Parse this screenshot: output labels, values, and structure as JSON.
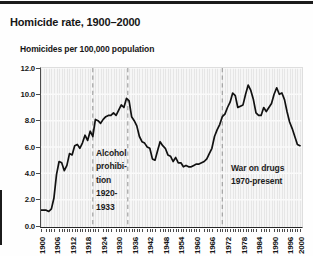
{
  "header": {
    "title": "Homicide rate, 1900–2000",
    "subtitle": "Homicides per 100,000 population"
  },
  "chart_data": {
    "type": "line",
    "title": "Homicide rate, 1900–2000",
    "ylabel": "Homicides per 100,000 population",
    "xlabel": "",
    "ylim": [
      0,
      12
    ],
    "line_color": "#111111",
    "grid": "horizontal white lines every 2.0 on striped gray panel",
    "legend": "none",
    "y_ticks": [
      "12.0",
      "10.0",
      "8.0",
      "6.0",
      "4.0",
      "2.0",
      "0.0"
    ],
    "grid_values": [
      2,
      4,
      6,
      8,
      10,
      12
    ],
    "x_ticks": [
      1900,
      1906,
      1912,
      1918,
      1924,
      1930,
      1936,
      1942,
      1948,
      1954,
      1960,
      1966,
      1972,
      1978,
      1984,
      1990,
      1996,
      2000
    ],
    "x": [
      1900,
      1901,
      1902,
      1903,
      1904,
      1905,
      1906,
      1907,
      1908,
      1909,
      1910,
      1911,
      1912,
      1913,
      1914,
      1915,
      1916,
      1917,
      1918,
      1919,
      1920,
      1921,
      1922,
      1923,
      1924,
      1925,
      1926,
      1927,
      1928,
      1929,
      1930,
      1931,
      1932,
      1933,
      1934,
      1935,
      1936,
      1937,
      1938,
      1939,
      1940,
      1941,
      1942,
      1943,
      1944,
      1945,
      1946,
      1947,
      1948,
      1949,
      1950,
      1951,
      1952,
      1953,
      1954,
      1955,
      1956,
      1957,
      1958,
      1959,
      1960,
      1961,
      1962,
      1963,
      1964,
      1965,
      1966,
      1967,
      1968,
      1969,
      1970,
      1971,
      1972,
      1973,
      1974,
      1975,
      1976,
      1977,
      1978,
      1979,
      1980,
      1981,
      1982,
      1983,
      1984,
      1985,
      1986,
      1987,
      1988,
      1989,
      1990,
      1991,
      1992,
      1993,
      1994,
      1995,
      1996,
      1997,
      1998,
      1999,
      2000
    ],
    "values": [
      1.2,
      1.2,
      1.2,
      1.1,
      1.3,
      2.1,
      3.9,
      4.9,
      4.8,
      4.2,
      4.6,
      5.5,
      5.4,
      6.1,
      6.2,
      5.9,
      6.3,
      6.9,
      6.5,
      7.2,
      6.8,
      8.1,
      8.0,
      7.8,
      8.1,
      8.3,
      8.4,
      8.4,
      8.6,
      8.4,
      8.8,
      9.2,
      9.0,
      9.7,
      9.5,
      8.3,
      8.0,
      7.6,
      6.8,
      6.4,
      6.3,
      6.0,
      5.9,
      5.1,
      5.0,
      5.7,
      6.4,
      6.1,
      5.9,
      5.4,
      5.3,
      4.9,
      5.2,
      4.8,
      4.8,
      4.5,
      4.6,
      4.5,
      4.5,
      4.6,
      4.7,
      4.7,
      4.8,
      4.9,
      5.1,
      5.5,
      5.9,
      6.8,
      7.3,
      7.7,
      8.3,
      8.5,
      9.0,
      9.4,
      10.1,
      9.9,
      9.0,
      9.1,
      9.2,
      10.0,
      10.7,
      10.3,
      9.6,
      8.6,
      8.4,
      8.4,
      9.0,
      8.7,
      9.0,
      9.3,
      10.0,
      10.5,
      10.0,
      10.1,
      9.6,
      8.7,
      7.9,
      7.4,
      6.8,
      6.2,
      6.1
    ],
    "reference_lines": [
      {
        "year": 1920,
        "style": "dashed"
      },
      {
        "year": 1933.5,
        "style": "dashed"
      },
      {
        "year": 1970,
        "style": "dashed"
      }
    ],
    "annotations": [
      {
        "name": "alcohol-prohibition",
        "lines": [
          "Alcohol",
          "prohibi-",
          "tion",
          "1920-",
          "1933"
        ]
      },
      {
        "name": "war-on-drugs",
        "lines": [
          "War on drugs",
          "1970-present"
        ]
      }
    ]
  }
}
